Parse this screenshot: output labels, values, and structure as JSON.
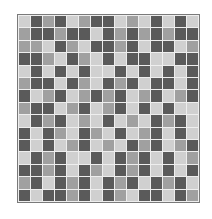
{
  "palette": {
    "L": "#d0d0d0",
    "M": "#a0a0a0",
    "D": "#5a5a5a",
    "gap": "#eeeeee",
    "border": "#7a7a7a"
  },
  "grid": {
    "rows": 15,
    "cols": 15,
    "cells": [
      "LDMDLMDDLMLDLDL",
      "MDDMDDLDMDMDMDD",
      "MMLDMLDDMDLDDLM",
      "DDMLDMLDLDDLLDD",
      "LDLDLDLLDLDLDLD",
      "MDDLDMLDMDLDDLD",
      "DLMDLMDMDLMDLMD",
      "MDDLMDLMDLDLDLL",
      "LDMDLMLDLMLDMDL",
      "DLDMLDMLDLMDLDL",
      "DLDLMDLMLDMDLMD",
      "LDMDLLDLDMDLDLM",
      "DDMDLDMLDMDLDLD",
      "MDLDMDLDMDLDMDL",
      "DLDDMDLDMLDDLDM"
    ]
  }
}
